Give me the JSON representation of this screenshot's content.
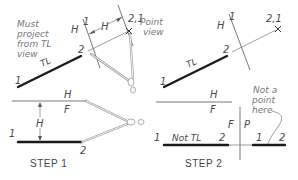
{
  "diagram": {
    "steps": [
      {
        "label": "STEP 1",
        "top_view": {
          "line_label": "TL",
          "end_labels": [
            "1",
            "2"
          ],
          "fold_line_label": "H 1",
          "fold_labels": {
            "h": "H",
            "one": "1"
          },
          "distance_label": "H",
          "point_label": "2,1",
          "point_note": "Point view",
          "side_note": [
            "Must",
            "project",
            "from TL",
            "view"
          ]
        },
        "front_view": {
          "fold_labels": {
            "top": "H",
            "bottom": "F"
          },
          "distance_label": "H",
          "end_labels": [
            "1",
            "2"
          ]
        }
      },
      {
        "label": "STEP 2",
        "top_view": {
          "line_label": "TL",
          "end_labels": [
            "1",
            "2"
          ],
          "fold_labels": {
            "h": "H",
            "one": "1"
          },
          "point_label": "2,1"
        },
        "front_view": {
          "fold_labels": {
            "top": "H",
            "bottom": "F"
          },
          "line_label": "Not TL",
          "end_labels": [
            "1",
            "2"
          ]
        },
        "profile_view": {
          "fold_labels": {
            "left": "F",
            "right": "P"
          },
          "end_labels": [
            "1",
            "2"
          ],
          "note": [
            "Not a",
            "point",
            "here"
          ]
        }
      }
    ]
  }
}
